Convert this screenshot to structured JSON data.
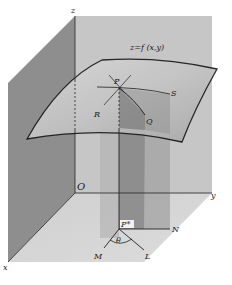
{
  "figure": {
    "type": "3d-surface-directional-derivative",
    "axes": {
      "x": "x",
      "y": "y",
      "z": "z",
      "origin": "O"
    },
    "surface_label": "z=f (x,y)",
    "points": {
      "P": "P",
      "Q": "Q",
      "R": "R",
      "S": "S",
      "P_projection": "P*",
      "M": "M",
      "L": "L",
      "N": "N"
    },
    "angle_label": "θ",
    "colors": {
      "back_wall": "#c8c8c8",
      "left_wall": "#8c8c8c",
      "floor": "#d2d2d2",
      "surface": "#bdbdbd",
      "vertical_plane_light": "#a9a9a9",
      "vertical_plane_dark": "#7d7d7d",
      "curve": "#1a1a1a"
    }
  }
}
